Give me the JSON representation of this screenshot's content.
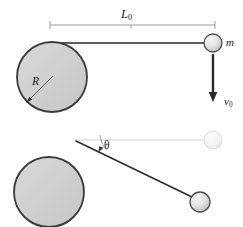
{
  "figure": {
    "background_color": "#ffffff",
    "width": 243,
    "height": 227,
    "labels": {
      "length": "L",
      "length_sub": "0",
      "mass": "m",
      "velocity": "v",
      "velocity_sub": "0",
      "radius": "R",
      "angle": "θ"
    },
    "colors": {
      "line_dark": "#2b2b2b",
      "line_light": "#c9c9c9",
      "circle_fill": "#cfcfcf",
      "circle_stroke": "#3a3a3a",
      "ball_fill": "#e2e2e2",
      "ball_stroke": "#4a4a4a",
      "ghost_fill": "#f2f2f2",
      "ghost_stroke": "#dcdcdc",
      "text": "#1a1a1a"
    }
  },
  "panels": {
    "top": {
      "name": "initial-configuration",
      "cylinder": {
        "cx": 52,
        "cy": 77,
        "r": 35
      },
      "ball": {
        "cx": 213,
        "cy": 43,
        "r": 9
      },
      "string": {
        "x1": 51,
        "y1": 43,
        "x2": 206,
        "y2": 43
      },
      "dimension_line": {
        "x1": 50,
        "y1": 25,
        "x2": 215,
        "y2": 25
      },
      "velocity_arrow": {
        "x1": 213,
        "y1": 54,
        "x2": 213,
        "y2": 101
      },
      "radius_line": {
        "x1": 52,
        "y1": 77,
        "x2": 27,
        "y2": 102
      }
    },
    "bottom": {
      "name": "wound-configuration",
      "cylinder": {
        "cx": 49,
        "cy": 192,
        "r": 35
      },
      "ball": {
        "cx": 200,
        "cy": 202,
        "r": 10
      },
      "ghost_ball": {
        "cx": 213,
        "cy": 140,
        "r": 9
      },
      "reference_line": {
        "x1": 76,
        "y1": 140,
        "x2": 205,
        "y2": 140
      },
      "string": {
        "x1": 78,
        "y1": 143,
        "x2": 191,
        "y2": 198
      },
      "angle_marker": {
        "cx": 99,
        "cy": 140,
        "radius": 17
      }
    }
  }
}
